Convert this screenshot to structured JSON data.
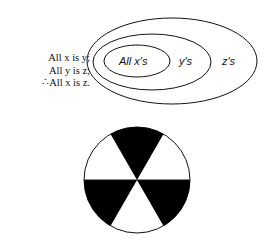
{
  "syllogism": {
    "lines": [
      "All x is y;",
      "All y is z;",
      "∴All x is z."
    ]
  },
  "euler_diagram": {
    "labels": {
      "inner": "All x's",
      "middle": "y's",
      "outer": "z's"
    }
  },
  "wheel": {
    "sectors": 6,
    "fill": "#000000",
    "background": "#ffffff"
  }
}
